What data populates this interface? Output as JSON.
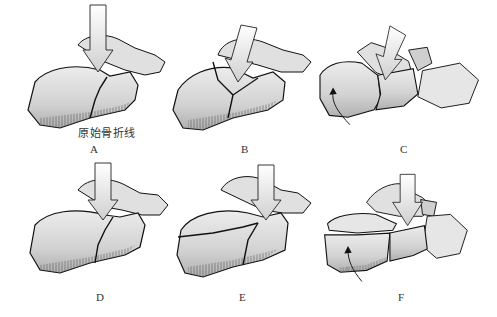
{
  "figure": {
    "panels": [
      {
        "id": "A",
        "label": "A",
        "caption": "原始骨折线"
      },
      {
        "id": "B",
        "label": "B"
      },
      {
        "id": "C",
        "label": "C"
      },
      {
        "id": "D",
        "label": "D"
      },
      {
        "id": "E",
        "label": "E"
      },
      {
        "id": "F",
        "label": "F"
      }
    ]
  },
  "colors": {
    "bone_fill": "#dcdcdc",
    "bone_shade": "#b8b8b8",
    "outline": "#111111",
    "arrow_fill": "#e6e6e6"
  }
}
